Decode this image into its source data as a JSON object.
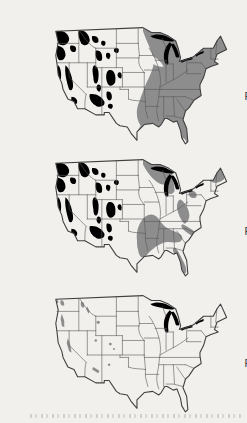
{
  "colors": {
    "background": "#f1f0ed",
    "land": "#f1f0ed",
    "forest": "#8d8d8d",
    "state_border": "#5a5a5a",
    "outline": "#3f3f3f",
    "lake": "#f5f4f1",
    "label_text": "#3a3a3a"
  },
  "maps": [
    {
      "id": "virgin-forests-1620",
      "label_lines": [
        "Virgin",
        "Forests",
        "1620"
      ]
    },
    {
      "id": "virgin-forests-1850",
      "label_lines": [
        "Virgin",
        "Forests",
        "1850"
      ]
    },
    {
      "id": "virgin-forests-today",
      "label_lines": [
        "Virgin",
        "Forests",
        "Today"
      ]
    }
  ]
}
